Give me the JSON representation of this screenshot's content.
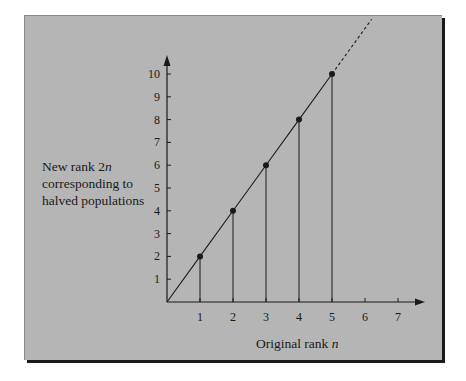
{
  "chart_data": {
    "type": "line",
    "title": "",
    "xlabel": "Original rank n",
    "xlabel_main": "Original rank ",
    "xlabel_var": "n",
    "ylabel": "New rank 2n corresponding to halved populations",
    "ylabel_lines": [
      "New rank 2",
      "corresponding to",
      "halved populations"
    ],
    "ylabel_var": "n",
    "x_ticks": [
      "1",
      "2",
      "3",
      "4",
      "5",
      "6",
      "7"
    ],
    "y_ticks": [
      "1",
      "2",
      "3",
      "4",
      "5",
      "6",
      "7",
      "8",
      "9",
      "10"
    ],
    "xlim": [
      0,
      7.8
    ],
    "ylim": [
      0,
      10.8
    ],
    "grid": false,
    "legend": null,
    "series": [
      {
        "name": "y = 2x",
        "x": [
          0,
          1,
          2,
          3,
          4,
          5
        ],
        "y": [
          0,
          2,
          4,
          6,
          8,
          10
        ],
        "markers": [
          [
            1,
            2
          ],
          [
            2,
            4
          ],
          [
            3,
            6
          ],
          [
            4,
            8
          ],
          [
            5,
            10
          ]
        ],
        "style": "solid",
        "dropline_to_x_axis": true
      },
      {
        "name": "extension",
        "x": [
          5,
          6.2
        ],
        "y": [
          10,
          12.4
        ],
        "style": "dashed"
      }
    ]
  },
  "colors": {
    "panel_bg": "#b5b5b5",
    "ink": "#1a1a1a",
    "shadow": "#1a1a1a"
  }
}
